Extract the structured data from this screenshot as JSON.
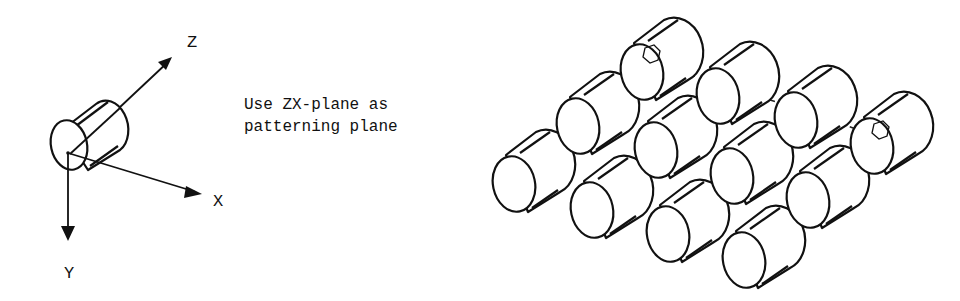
{
  "axes": {
    "z_label": "Z",
    "x_label": "X",
    "y_label": "Y"
  },
  "note": {
    "line1": "Use ZX-plane as",
    "line2": "patterning plane"
  },
  "pattern": {
    "rows": 3,
    "columns": 4,
    "instance_count": 12,
    "origin_marker": "hexagon",
    "colors": {
      "line": "#111111",
      "background": "#ffffff"
    }
  }
}
